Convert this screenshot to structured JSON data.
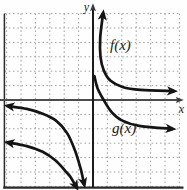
{
  "figure": {
    "y_axis_label": "y",
    "x_axis_label": "x",
    "f_label": "f(x)",
    "g_label": "g(x)"
  },
  "colors": {
    "background": "#fefefe",
    "curve": "#141414",
    "x_axis": "#4d4d4d",
    "y_axis": "#1c1c1c",
    "grid": "#a3a3a3",
    "border": "#2b2b2b",
    "label": "#1a1a1a"
  },
  "chart_data": {
    "type": "line",
    "title": "",
    "xlabel": "x",
    "ylabel": "y",
    "xlim": [
      -6,
      6
    ],
    "ylim": [
      -6,
      6
    ],
    "grid": true,
    "grid_style": "dotted",
    "tick_labels": "none",
    "legend_position": "none",
    "series": [
      {
        "name": "f(x)",
        "branches": [
          {
            "quadrant": "I",
            "arrow_start": "up",
            "arrow_end": "right",
            "points": [
              [
                0.7,
                6.0
              ],
              [
                0.5,
                4.3
              ],
              [
                0.52,
                3.0
              ],
              [
                0.75,
                2.05
              ],
              [
                1.2,
                1.35
              ],
              [
                2.05,
                0.9
              ],
              [
                3.3,
                0.7
              ],
              [
                5.6,
                0.62
              ]
            ]
          },
          {
            "quadrant": "III",
            "arrow_start": "left",
            "arrow_end": "down",
            "points": [
              [
                -5.9,
                -0.42
              ],
              [
                -4.6,
                -0.62
              ],
              [
                -3.5,
                -0.95
              ],
              [
                -2.55,
                -1.45
              ],
              [
                -1.8,
                -2.3
              ],
              [
                -1.25,
                -3.5
              ],
              [
                -0.85,
                -4.8
              ],
              [
                -0.62,
                -5.85
              ]
            ]
          }
        ]
      },
      {
        "name": "g(x)",
        "branches": [
          {
            "quadrant": "I-IV",
            "arrow_start": "none",
            "arrow_end": "right",
            "points": [
              [
                0.1,
                1.65
              ],
              [
                0.32,
                0.8
              ],
              [
                0.8,
                -0.1
              ],
              [
                1.3,
                -0.85
              ],
              [
                2.0,
                -1.42
              ],
              [
                3.3,
                -1.82
              ],
              [
                5.5,
                -2.0
              ]
            ]
          },
          {
            "quadrant": "III",
            "arrow_start": "left",
            "arrow_end": "down",
            "points": [
              [
                -5.9,
                -2.95
              ],
              [
                -4.6,
                -3.2
              ],
              [
                -3.5,
                -3.6
              ],
              [
                -2.6,
                -4.2
              ],
              [
                -1.9,
                -4.95
              ],
              [
                -1.6,
                -5.3
              ],
              [
                -1.15,
                -6.05
              ]
            ]
          }
        ]
      }
    ],
    "annotations": [
      {
        "text": "f(x)",
        "x": 2.1,
        "y": 4.0
      },
      {
        "text": "g(x)",
        "x": 2.4,
        "y": -1.8
      }
    ]
  }
}
